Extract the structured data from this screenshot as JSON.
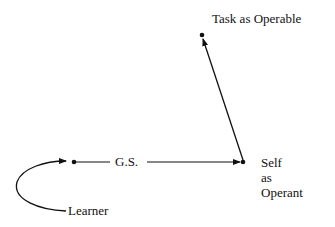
{
  "diagram": {
    "nodes": {
      "task": {
        "label": "Task as Operable"
      },
      "self": {
        "line1": "Self",
        "line2": "as",
        "line3": "Operant"
      },
      "learner": {
        "label": "Learner"
      }
    },
    "edges": {
      "gs": {
        "label": "G.S."
      }
    }
  }
}
